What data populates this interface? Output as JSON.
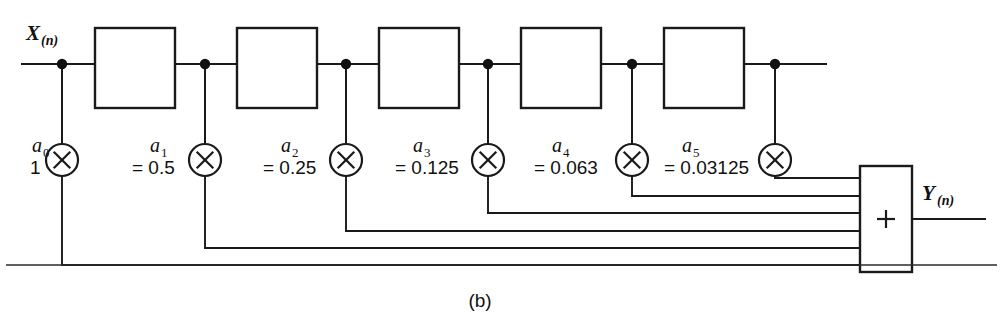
{
  "figure": {
    "caption": "(b)",
    "input_label": {
      "base": "X",
      "sub": "(n)"
    },
    "output_label": {
      "base": "Y",
      "sub": "(n)"
    },
    "summer_symbol": "+",
    "multiplier_symbol": "×",
    "delay_block_label": "",
    "colors": {
      "line": "#1a1a1a",
      "background": "#ffffff",
      "text": "#111111"
    }
  },
  "chart_data": {
    "type": "diagram",
    "subtitle": "(b)",
    "structure": "tapped-delay-line",
    "xlabel": "",
    "ylabel": "",
    "n_delay_blocks": 5,
    "n_taps": 6,
    "categories": [
      "a0",
      "a1",
      "a2",
      "a3",
      "a4",
      "a5"
    ],
    "values": [
      1,
      0.5,
      0.25,
      0.125,
      0.063,
      0.03125
    ],
    "series": [
      {
        "name": "coefficient",
        "values": [
          1,
          0.5,
          0.25,
          0.125,
          0.063,
          0.03125
        ]
      }
    ],
    "annotations": [
      "X(n)",
      "Y(n)",
      "+",
      "(b)"
    ]
  },
  "taps": [
    {
      "id": "tap-0",
      "name": "a0",
      "coef_base": "a",
      "coef_sub": "0",
      "value_text": "1",
      "value": 1,
      "node_x": 62,
      "mult_cx": 62,
      "label_x": 32,
      "bus_y": 265
    },
    {
      "id": "tap-1",
      "name": "a1",
      "coef_base": "a",
      "coef_sub": "1",
      "value_text": "= 0.5",
      "value": 0.5,
      "node_x": 205,
      "mult_cx": 205,
      "label_x": 150,
      "bus_y": 248
    },
    {
      "id": "tap-2",
      "name": "a2",
      "coef_base": "a",
      "coef_sub": "2",
      "value_text": "= 0.25",
      "value": 0.25,
      "node_x": 346,
      "mult_cx": 346,
      "label_x": 281,
      "bus_y": 231
    },
    {
      "id": "tap-3",
      "name": "a3",
      "coef_base": "a",
      "coef_sub": "3",
      "value_text": "= 0.125",
      "value": 0.125,
      "node_x": 488,
      "mult_cx": 488,
      "label_x": 413,
      "bus_y": 213
    },
    {
      "id": "tap-4",
      "name": "a4",
      "coef_base": "a",
      "coef_sub": "4",
      "value_text": "= 0.063",
      "value": 0.063,
      "node_x": 632,
      "mult_cx": 632,
      "label_x": 552,
      "bus_y": 196
    },
    {
      "id": "tap-5",
      "name": "a5",
      "coef_base": "a",
      "coef_sub": "5",
      "value_text": "= 0.03125",
      "value": 0.03125,
      "node_x": 775,
      "mult_cx": 775,
      "label_x": 682,
      "bus_y": 178
    }
  ],
  "delay_blocks": [
    {
      "id": "delay-1",
      "x": 95,
      "y": 28,
      "w": 80,
      "h": 80
    },
    {
      "id": "delay-2",
      "x": 237,
      "y": 28,
      "w": 80,
      "h": 80
    },
    {
      "id": "delay-3",
      "x": 379,
      "y": 28,
      "w": 80,
      "h": 80
    },
    {
      "id": "delay-4",
      "x": 521,
      "y": 28,
      "w": 80,
      "h": 80
    },
    {
      "id": "delay-5",
      "x": 664,
      "y": 28,
      "w": 80,
      "h": 80
    }
  ],
  "geometry": {
    "main_line_y": 64,
    "main_line_x0": 22,
    "main_line_x1": 826,
    "mult_cy": 160,
    "mult_r": 16,
    "summer": {
      "x": 860,
      "y": 166,
      "w": 52,
      "h": 106
    },
    "output_y": 219,
    "output_x1": 985,
    "rule_y": 265,
    "rule_x0": 6,
    "rule_x1": 997,
    "caption_x": 480,
    "caption_y": 307
  }
}
